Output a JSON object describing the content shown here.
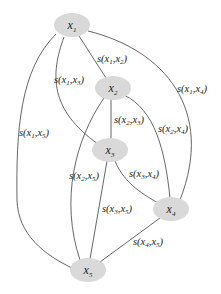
{
  "diagram": {
    "type": "graph",
    "title": "",
    "node_fill": "#d9d9d9",
    "edge_color": "#555555",
    "nodes": [
      {
        "id": "x1",
        "base": "x",
        "sub": "1"
      },
      {
        "id": "x2",
        "base": "x",
        "sub": "2"
      },
      {
        "id": "x3",
        "base": "x",
        "sub": "3"
      },
      {
        "id": "x4",
        "base": "x",
        "sub": "4"
      },
      {
        "id": "x5",
        "base": "x",
        "sub": "5"
      }
    ],
    "edges": [
      {
        "from": "x1",
        "to": "x2",
        "label": "s(x1,x2)"
      },
      {
        "from": "x1",
        "to": "x3",
        "label": "s(x1,x3)"
      },
      {
        "from": "x1",
        "to": "x4",
        "label": "s(x1,x4)"
      },
      {
        "from": "x1",
        "to": "x5",
        "label": "s(x1,x5)"
      },
      {
        "from": "x2",
        "to": "x3",
        "label": "s(x2,x3)"
      },
      {
        "from": "x2",
        "to": "x4",
        "label": "s(x2,x4)"
      },
      {
        "from": "x2",
        "to": "x5",
        "label": "s(x2,x5)"
      },
      {
        "from": "x3",
        "to": "x4",
        "label": "s(x3,x4)"
      },
      {
        "from": "x3",
        "to": "x5",
        "label": "s(x3,x5)"
      },
      {
        "from": "x4",
        "to": "x5",
        "label": "s(x4,x5)"
      }
    ]
  },
  "labels": {
    "x": "x",
    "s": "s(",
    "comma": ",",
    "close": ")",
    "n1": "1",
    "n2": "2",
    "n3": "3",
    "n4": "4",
    "n5": "5"
  }
}
